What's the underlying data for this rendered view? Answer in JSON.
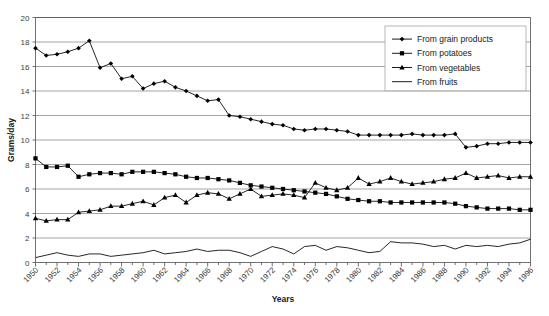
{
  "chart_data": {
    "type": "line",
    "title": "",
    "xlabel": "Years",
    "ylabel": "Grams/day",
    "xlim": [
      1950,
      1996
    ],
    "ylim": [
      0,
      20
    ],
    "ytick_step": 2,
    "yticks": [
      0,
      2,
      4,
      6,
      8,
      10,
      12,
      14,
      16,
      18,
      20
    ],
    "xticks": [
      1950,
      1952,
      1954,
      1956,
      1958,
      1960,
      1962,
      1964,
      1966,
      1968,
      1970,
      1972,
      1974,
      1976,
      1978,
      1980,
      1982,
      1984,
      1986,
      1988,
      1990,
      1992,
      1994,
      1996
    ],
    "xtick_labels": [
      "1950",
      "1952",
      "1954",
      "1956",
      "1958",
      "1960",
      "1962",
      "1964",
      "1966",
      "1968",
      "1970",
      "1972",
      "1974",
      "1976",
      "1978",
      "1980",
      "1982",
      "1984",
      "1986",
      "1988",
      "1990",
      "1992",
      "1994",
      "1996"
    ],
    "minor_xticks_every_year": true,
    "grid": "horizontal",
    "legend_position": "top-right",
    "x": [
      1950,
      1951,
      1952,
      1953,
      1954,
      1955,
      1956,
      1957,
      1958,
      1959,
      1960,
      1961,
      1962,
      1963,
      1964,
      1965,
      1966,
      1967,
      1968,
      1969,
      1970,
      1971,
      1972,
      1973,
      1974,
      1975,
      1976,
      1977,
      1978,
      1979,
      1980,
      1981,
      1982,
      1983,
      1984,
      1985,
      1986,
      1987,
      1988,
      1989,
      1990,
      1991,
      1992,
      1993,
      1994,
      1995,
      1996
    ],
    "series": [
      {
        "name": "From grain products",
        "marker": "diamond",
        "color": "#000000",
        "values": [
          17.5,
          16.9,
          17.0,
          17.2,
          17.5,
          18.1,
          15.9,
          16.25,
          15.0,
          15.2,
          14.2,
          14.6,
          14.8,
          14.3,
          14.0,
          13.6,
          13.2,
          13.3,
          12.0,
          11.9,
          11.7,
          11.5,
          11.3,
          11.2,
          10.9,
          10.8,
          10.9,
          10.9,
          10.8,
          10.7,
          10.4,
          10.4,
          10.4,
          10.4,
          10.4,
          10.5,
          10.4,
          10.4,
          10.4,
          10.5,
          9.4,
          9.5,
          9.7,
          9.7,
          9.8,
          9.8,
          9.8
        ]
      },
      {
        "name": "From potatoes",
        "marker": "square",
        "color": "#000000",
        "values": [
          8.5,
          7.8,
          7.8,
          7.9,
          7.0,
          7.2,
          7.3,
          7.3,
          7.2,
          7.4,
          7.4,
          7.4,
          7.3,
          7.2,
          7.0,
          6.9,
          6.9,
          6.8,
          6.7,
          6.5,
          6.3,
          6.2,
          6.1,
          6.0,
          5.9,
          5.8,
          5.7,
          5.6,
          5.4,
          5.2,
          5.1,
          5.0,
          5.0,
          4.9,
          4.9,
          4.9,
          4.9,
          4.9,
          4.9,
          4.8,
          4.6,
          4.5,
          4.4,
          4.4,
          4.4,
          4.3,
          4.3
        ]
      },
      {
        "name": "From vegetables",
        "marker": "triangle",
        "color": "#000000",
        "values": [
          3.6,
          3.4,
          3.5,
          3.5,
          4.1,
          4.2,
          4.3,
          4.6,
          4.6,
          4.8,
          5.0,
          4.7,
          5.3,
          5.5,
          4.9,
          5.5,
          5.7,
          5.6,
          5.2,
          5.6,
          6.0,
          5.4,
          5.5,
          5.6,
          5.5,
          5.3,
          6.5,
          6.1,
          5.9,
          6.1,
          6.9,
          6.4,
          6.6,
          6.9,
          6.6,
          6.4,
          6.5,
          6.6,
          6.8,
          6.9,
          7.3,
          6.9,
          7.0,
          7.1,
          6.9,
          7.0,
          7.0
        ]
      },
      {
        "name": "From fruits",
        "marker": "none",
        "color": "#000000",
        "values": [
          0.4,
          0.6,
          0.8,
          0.6,
          0.5,
          0.7,
          0.7,
          0.5,
          0.6,
          0.7,
          0.8,
          1.0,
          0.7,
          0.8,
          0.9,
          1.1,
          0.9,
          1.0,
          1.0,
          0.8,
          0.5,
          0.9,
          1.3,
          1.1,
          0.7,
          1.3,
          1.4,
          1.0,
          1.3,
          1.2,
          1.0,
          0.8,
          0.9,
          1.7,
          1.6,
          1.6,
          1.5,
          1.3,
          1.4,
          1.1,
          1.4,
          1.3,
          1.4,
          1.3,
          1.5,
          1.6,
          1.9
        ]
      }
    ]
  },
  "legend": {
    "items": [
      {
        "label": "From grain products"
      },
      {
        "label": "From potatoes"
      },
      {
        "label": "From vegetables"
      },
      {
        "label": "From fruits"
      }
    ]
  },
  "axes": {
    "y_title": "Grams/day",
    "x_title": "Years"
  }
}
